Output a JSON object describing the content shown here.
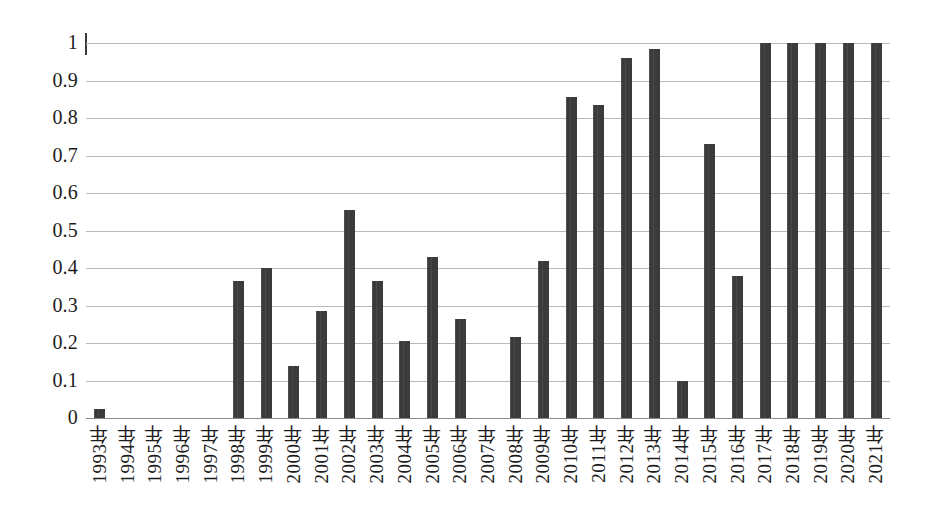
{
  "chart_data": {
    "type": "bar",
    "title": "",
    "subtitle": "",
    "xlabel": "",
    "ylabel": "",
    "ylim": [
      0,
      1
    ],
    "xlim_categories": 29,
    "grid": true,
    "legend": false,
    "legend_position": "none",
    "bar_color": "#3b3b3b",
    "gridline_color": "#b9b9b9",
    "background_color": "#ffffff",
    "y_ticks": [
      "0",
      "0.1",
      "0.2",
      "0.3",
      "0.4",
      "0.5",
      "0.6",
      "0.7",
      "0.8",
      "0.9",
      "1"
    ],
    "y_tick_values": [
      0,
      0.1,
      0.2,
      0.3,
      0.4,
      0.5,
      0.6,
      0.7,
      0.8,
      0.9,
      1
    ],
    "categories": [
      "1993年",
      "1994年",
      "1995年",
      "1996年",
      "1997年",
      "1998年",
      "1999年",
      "2000年",
      "2001年",
      "2002年",
      "2003年",
      "2004年",
      "2005年",
      "2006年",
      "2007年",
      "2008年",
      "2009年",
      "2010年",
      "2011年",
      "2012年",
      "2013年",
      "2014年",
      "2015年",
      "2016年",
      "2017年",
      "2018年",
      "2019年",
      "2020年",
      "2021年"
    ],
    "values": [
      0.025,
      0,
      0,
      0,
      0,
      0.365,
      0.4,
      0.14,
      0.285,
      0.555,
      0.365,
      0.205,
      0.43,
      0.265,
      0,
      0.215,
      0.42,
      0.855,
      0.835,
      0.96,
      0.985,
      0.098,
      0.73,
      0.38,
      1,
      1,
      1,
      1,
      1
    ]
  }
}
